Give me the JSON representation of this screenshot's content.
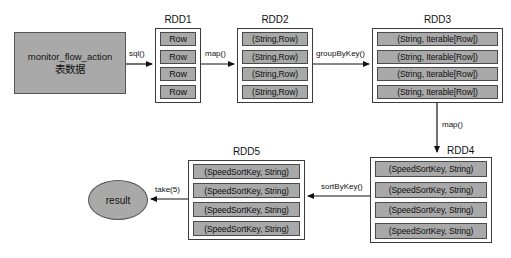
{
  "diagram": {
    "background": "#ffffff",
    "node_fill": "#a9a9a9",
    "node_stroke": "#3b3b3b",
    "source": {
      "line1": "monitor_flow_action",
      "line2": "表数据"
    },
    "result": {
      "label": "result"
    },
    "rdds": [
      {
        "id": "rdd1",
        "title": "RDD1",
        "items": [
          "Row",
          "Row",
          "Row",
          "Row"
        ]
      },
      {
        "id": "rdd2",
        "title": "RDD2",
        "items": [
          "(String,Row)",
          "(String,Row)",
          "(String,Row)",
          "(String,Row)"
        ]
      },
      {
        "id": "rdd3",
        "title": "RDD3",
        "items": [
          "(String, Iterable[Row])",
          "(String, Iterable[Row])",
          "(String, Iterable[Row])",
          "(String, Iterable[Row])"
        ]
      },
      {
        "id": "rdd4",
        "title": "RDD4",
        "items": [
          "(SpeedSortKey, String)",
          "(SpeedSortKey, String)",
          "(SpeedSortKey, String)",
          "(SpeedSortKey, String)"
        ]
      },
      {
        "id": "rdd5",
        "title": "RDD5",
        "items": [
          "(SpeedSortKey, String)",
          "(SpeedSortKey, String)",
          "(SpeedSortKey, String)",
          "(SpeedSortKey, String)"
        ]
      }
    ],
    "edges": [
      {
        "id": "sql",
        "label": "sql()"
      },
      {
        "id": "map1",
        "label": "map()"
      },
      {
        "id": "groupbykey",
        "label": "groupByKey()"
      },
      {
        "id": "map2",
        "label": "map()"
      },
      {
        "id": "sortbykey",
        "label": "sortByKey()"
      },
      {
        "id": "take",
        "label": "take(5)"
      }
    ]
  }
}
